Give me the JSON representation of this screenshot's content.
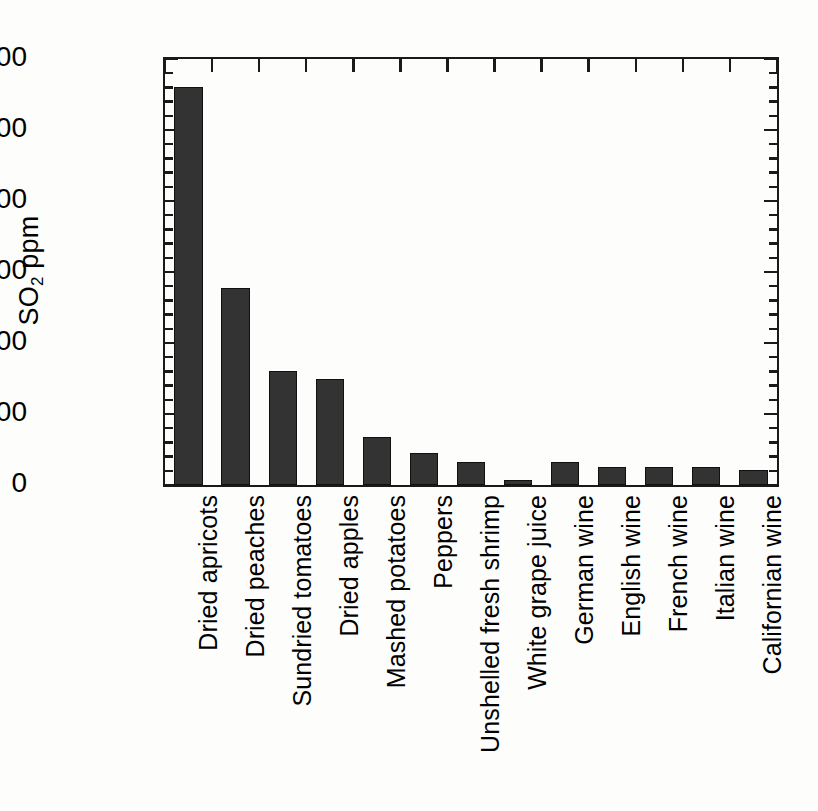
{
  "chart_data": {
    "type": "bar",
    "title": "",
    "xlabel": "",
    "ylabel": "SO2 ppm",
    "ylabel_parts": {
      "prefix": "SO",
      "subscript": "2",
      "suffix": " ppm"
    },
    "ylim": [
      0,
      3000
    ],
    "yticks": [
      0,
      500,
      1000,
      1500,
      2000,
      2500,
      3000
    ],
    "ytick_labels": [
      "0",
      "500",
      "1000",
      "1500",
      "2000",
      "2500",
      "3000"
    ],
    "minor_tick_interval": 100,
    "grid": false,
    "legend": null,
    "frame": "full-box",
    "bar_color": "#333333",
    "bar_edge_color": "#111111",
    "axis_color": "#1a1a1a",
    "categories": [
      "Dried apricots",
      "Dried peaches",
      "Sundried tomatoes",
      "Dried apples",
      "Mashed potatoes",
      "Peppers",
      "Unshelled fresh shrimp",
      "White grape juice",
      "German wine",
      "English wine",
      "French wine",
      "Italian wine",
      "Californian wine"
    ],
    "values": [
      2800,
      1390,
      800,
      745,
      340,
      225,
      165,
      35,
      160,
      130,
      130,
      125,
      105
    ]
  }
}
